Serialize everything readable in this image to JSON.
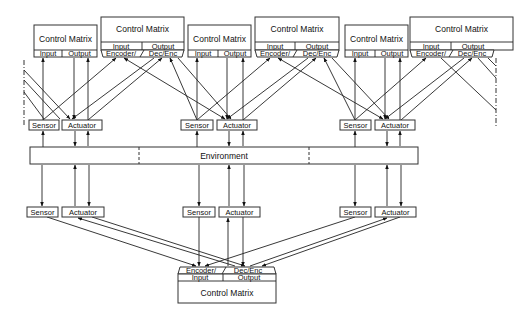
{
  "diagram": {
    "environment": {
      "label": "Environment"
    },
    "top_simple_matrices": [
      {
        "title": "Control Matrix",
        "input": "Input",
        "output": "Output"
      },
      {
        "title": "Control Matrix",
        "input": "Input",
        "output": "Output"
      },
      {
        "title": "Control Matrix",
        "input": "Input",
        "output": "Output"
      }
    ],
    "top_encoder_matrices": [
      {
        "title": "Control Matrix",
        "input": "Input",
        "output": "Output",
        "encoder": "Encoder/",
        "dec_enc": "Dec/Enc"
      },
      {
        "title": "Control Matrix",
        "input": "Input",
        "output": "Output",
        "encoder": "Encoder/",
        "dec_enc": "Dec/Enc"
      },
      {
        "title": "Control Matrix",
        "input": "Input",
        "output": "Output",
        "encoder": "Encoder/",
        "dec_enc": "Dec/Enc"
      }
    ],
    "upper_units": [
      {
        "sensor": "Sensor",
        "actuator": "Actuator"
      },
      {
        "sensor": "Sensor",
        "actuator": "Actuator"
      },
      {
        "sensor": "Sensor",
        "actuator": "Actuator"
      }
    ],
    "lower_units": [
      {
        "sensor": "Sensor",
        "actuator": "Actuator"
      },
      {
        "sensor": "Sensor",
        "actuator": "Actuator"
      },
      {
        "sensor": "Sensor",
        "actuator": "Actuator"
      }
    ],
    "bottom_matrix": {
      "title": "Control Matrix",
      "input": "Input",
      "output": "Output",
      "encoder": "Encoder/",
      "dec_enc": "Dec/Enc"
    }
  }
}
